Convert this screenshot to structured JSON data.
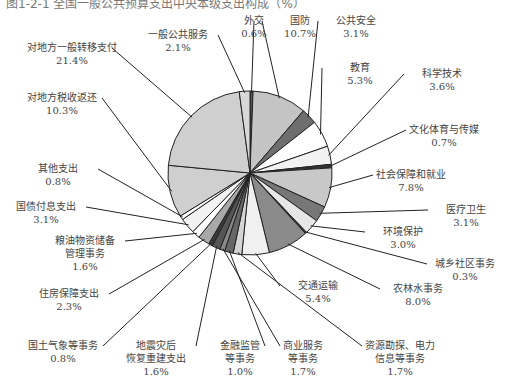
{
  "caption": "图1-2-1 全国一般公共预算支出中央本级支出构成（%）",
  "chart_data": {
    "type": "pie",
    "title": "",
    "start_angle_deg": 0,
    "direction": "clockwise",
    "slices": [
      {
        "label": "外交",
        "value": 0.6,
        "fill": "#555555",
        "lx": 262,
        "ly": 33,
        "ax": 251,
        "ay": 91
      },
      {
        "label": "国防",
        "value": 10.7,
        "fill": "#c4c4c4",
        "lx": 305,
        "ly": 16,
        "ax": 278,
        "ay": 96
      },
      {
        "label": "公共安全",
        "value": 3.1,
        "fill": "#6e6e6e",
        "lx": 356,
        "ly": 16,
        "ax": 307,
        "ay": 115
      },
      {
        "label": "教育",
        "value": 5.3,
        "fill": "#ffffff",
        "lx": 357,
        "ly": 56,
        "ax": 321,
        "ay": 132
      },
      {
        "label": "科学技术",
        "value": 3.6,
        "fill": "#f2f2f2",
        "lx": 441,
        "ly": 72,
        "ax": 329,
        "ay": 153
      },
      {
        "label": "文化体育与传媒",
        "value": 0.7,
        "fill": "#333333",
        "lx": 455,
        "ly": 127,
        "ax": 332,
        "ay": 168
      },
      {
        "label": "社会保障和就业",
        "value": 7.8,
        "fill": "#c8c8c8",
        "lx": 447,
        "ly": 180,
        "ax": 331,
        "ay": 183
      },
      {
        "label": "医疗卫生",
        "value": 3.1,
        "fill": "#777777",
        "lx": 476,
        "ly": 217,
        "ax": 324,
        "ay": 208
      },
      {
        "label": "环境保护",
        "value": 3.0,
        "fill": "#e6e6e6",
        "lx": 395,
        "ly": 240,
        "ax": 317,
        "ay": 219
      },
      {
        "label": "城乡社区事务",
        "value": 0.3,
        "fill": "#444444",
        "lx": 460,
        "ly": 265,
        "ax": 309,
        "ay": 227
      },
      {
        "label": "农林水事务",
        "value": 8.0,
        "fill": "#8a8a8a",
        "lx": 405,
        "ly": 290,
        "ax": 294,
        "ay": 243
      },
      {
        "label": "交通运输",
        "value": 5.4,
        "fill": "#f0f0f0",
        "lx": 322,
        "ly": 289,
        "ax": 262,
        "ay": 255
      },
      {
        "label": "资源勘探、电力信息等事务",
        "value": 1.7,
        "fill": "#d4d4d4",
        "lx": 400,
        "ly": 352,
        "ax": 241,
        "ay": 255
      },
      {
        "label": "商业服务等事务",
        "value": 1.7,
        "fill": "#666666",
        "lx": 305,
        "ly": 352,
        "ax": 233,
        "ay": 253
      },
      {
        "label": "金融监管等事务",
        "value": 1.0,
        "fill": "#888888",
        "lx": 239,
        "ly": 352,
        "ax": 226,
        "ay": 251
      },
      {
        "label": "地震灾后恢复重建支出",
        "value": 1.6,
        "fill": "#555555",
        "lx": 160,
        "ly": 352,
        "ax": 218,
        "ay": 248
      },
      {
        "label": "国土气象等事务",
        "value": 0.8,
        "fill": "#3a3a3a",
        "lx": 63,
        "ly": 352,
        "ax": 211,
        "ay": 245
      },
      {
        "label": "住房保障支出",
        "value": 2.3,
        "fill": "#a8a8a8",
        "lx": 72,
        "ly": 303,
        "ax": 205,
        "ay": 241
      },
      {
        "label": "粮油物资储备管理事务",
        "value": 1.6,
        "fill": "#ffffff",
        "lx": 91,
        "ly": 257,
        "ax": 197,
        "ay": 233
      },
      {
        "label": "国债付息支出",
        "value": 3.1,
        "fill": "#f2f2f2",
        "lx": 48,
        "ly": 213,
        "ax": 191,
        "ay": 226
      },
      {
        "label": "其他支出",
        "value": 0.8,
        "fill": "#ffffff",
        "lx": 57,
        "ly": 178,
        "ax": 185,
        "ay": 217
      },
      {
        "label": "对地方税收返还",
        "value": 10.3,
        "fill": "#cfcfcf",
        "lx": 63,
        "ly": 108,
        "ax": 170,
        "ay": 190
      },
      {
        "label": "对地方一般转移支付",
        "value": 21.4,
        "fill": "#cfcfcf",
        "lx": 67,
        "ly": 52,
        "ax": 190,
        "ay": 116
      },
      {
        "label": "一般公共服务",
        "value": 2.1,
        "fill": "#d8d8d8",
        "lx": 177,
        "ly": 27,
        "ax": 243,
        "ay": 92
      }
    ],
    "display_labels": [
      {
        "lines": [
          "外交",
          "0.6%"
        ],
        "x": 254,
        "y": 24
      },
      {
        "lines": [
          "国防",
          "10.7%"
        ],
        "x": 300,
        "y": 24
      },
      {
        "lines": [
          "公共安全",
          "3.1%"
        ],
        "x": 356,
        "y": 24
      },
      {
        "lines": [
          "教育",
          "5.3%"
        ],
        "x": 360,
        "y": 71
      },
      {
        "lines": [
          "科学技术",
          "3.6%"
        ],
        "x": 442,
        "y": 77
      },
      {
        "lines": [
          "文化体育与传媒",
          "0.7%"
        ],
        "x": 444,
        "y": 133
      },
      {
        "lines": [
          "社会保障和就业",
          "7.8%"
        ],
        "x": 411,
        "y": 178
      },
      {
        "lines": [
          "医疗卫生",
          "3.1%"
        ],
        "x": 466,
        "y": 213
      },
      {
        "lines": [
          "环境保护",
          "3.0%"
        ],
        "x": 403,
        "y": 235
      },
      {
        "lines": [
          "城乡社区事务",
          "0.3%"
        ],
        "x": 465,
        "y": 267
      },
      {
        "lines": [
          "农林水事务",
          "8.0%"
        ],
        "x": 418,
        "y": 292
      },
      {
        "lines": [
          "交通运输",
          "5.4%"
        ],
        "x": 318,
        "y": 289
      },
      {
        "lines": [
          "资源勘探、电力",
          "信息等事务",
          "1.7%"
        ],
        "x": 400,
        "y": 349
      },
      {
        "lines": [
          "商业服务",
          "等事务",
          "1.7%"
        ],
        "x": 303,
        "y": 349
      },
      {
        "lines": [
          "金融监管",
          "等事务",
          "1.0%"
        ],
        "x": 240,
        "y": 349
      },
      {
        "lines": [
          "地震灾后",
          "恢复重建支出",
          "1.6%"
        ],
        "x": 156,
        "y": 349
      },
      {
        "lines": [
          "国土气象等事务",
          "0.8%"
        ],
        "x": 63,
        "y": 349
      },
      {
        "lines": [
          "住房保障支出",
          "2.3%"
        ],
        "x": 69,
        "y": 297
      },
      {
        "lines": [
          "粮油物资储备",
          "管理事务",
          "1.6%"
        ],
        "x": 85,
        "y": 244
      },
      {
        "lines": [
          "国债付息支出",
          "3.1%"
        ],
        "x": 46,
        "y": 210
      },
      {
        "lines": [
          "其他支出",
          "0.8%"
        ],
        "x": 58,
        "y": 172
      },
      {
        "lines": [
          "对地方税收返还",
          "10.3%"
        ],
        "x": 62,
        "y": 101
      },
      {
        "lines": [
          "对地方一般转移支付",
          "21.4%"
        ],
        "x": 72,
        "y": 51
      },
      {
        "lines": [
          "一般公共服务",
          "2.1%"
        ],
        "x": 178,
        "y": 38
      }
    ],
    "center": [
      250,
      173
    ],
    "radius": 82,
    "legend": "none",
    "unit": "%"
  }
}
